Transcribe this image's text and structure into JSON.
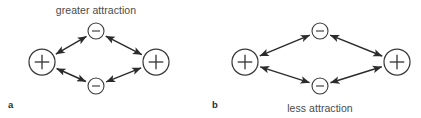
{
  "figure": {
    "width": 421,
    "height": 118,
    "background": "#ffffff",
    "stroke_color": "#2b2b2b",
    "node_stroke_color": "#3a3a3a",
    "text_color": "#4a4a4a"
  },
  "panels": [
    {
      "letter": "a",
      "letter_x": 8,
      "letter_y": 108,
      "caption": "greater attraction",
      "caption_x": 96,
      "caption_y": 14,
      "caption_position": "top",
      "nodes": [
        {
          "id": "a-left-plus",
          "sign": "+",
          "label": "+",
          "size": "big",
          "cx": 42,
          "cy": 62,
          "r": 13
        },
        {
          "id": "a-top-minus",
          "sign": "-",
          "label": "−",
          "size": "small",
          "cx": 96,
          "cy": 31,
          "r": 8
        },
        {
          "id": "a-right-plus",
          "sign": "+",
          "label": "+",
          "size": "big",
          "cx": 156,
          "cy": 62,
          "r": 13
        },
        {
          "id": "a-bottom-minus",
          "sign": "-",
          "label": "−",
          "size": "small",
          "cx": 96,
          "cy": 86,
          "r": 8
        }
      ],
      "edges": [
        {
          "id": "a-edge-left-top",
          "from": "a-left-plus",
          "to": "a-top-minus",
          "arrows": "both"
        },
        {
          "id": "a-edge-top-right",
          "from": "a-top-minus",
          "to": "a-right-plus",
          "arrows": "both"
        },
        {
          "id": "a-edge-right-bottom",
          "from": "a-right-plus",
          "to": "a-bottom-minus",
          "arrows": "both"
        },
        {
          "id": "a-edge-bottom-left",
          "from": "a-bottom-minus",
          "to": "a-left-plus",
          "arrows": "both"
        }
      ]
    },
    {
      "letter": "b",
      "letter_x": 212,
      "letter_y": 108,
      "caption": "less attraction",
      "caption_x": 320,
      "caption_y": 112,
      "caption_position": "bottom",
      "nodes": [
        {
          "id": "b-left-plus",
          "sign": "+",
          "label": "+",
          "size": "big",
          "cx": 245,
          "cy": 62,
          "r": 13
        },
        {
          "id": "b-top-minus",
          "sign": "-",
          "label": "−",
          "size": "small",
          "cx": 320,
          "cy": 31,
          "r": 8
        },
        {
          "id": "b-right-plus",
          "sign": "+",
          "label": "+",
          "size": "big",
          "cx": 397,
          "cy": 62,
          "r": 13
        },
        {
          "id": "b-bottom-minus",
          "sign": "-",
          "label": "−",
          "size": "small",
          "cx": 320,
          "cy": 86,
          "r": 8
        }
      ],
      "edges": [
        {
          "id": "b-edge-left-top",
          "from": "b-left-plus",
          "to": "b-top-minus",
          "arrows": "both"
        },
        {
          "id": "b-edge-top-right",
          "from": "b-top-minus",
          "to": "b-right-plus",
          "arrows": "both"
        },
        {
          "id": "b-edge-right-bottom",
          "from": "b-right-plus",
          "to": "b-bottom-minus",
          "arrows": "both"
        },
        {
          "id": "b-edge-bottom-left",
          "from": "b-bottom-minus",
          "to": "b-left-plus",
          "arrows": "both"
        }
      ]
    }
  ]
}
